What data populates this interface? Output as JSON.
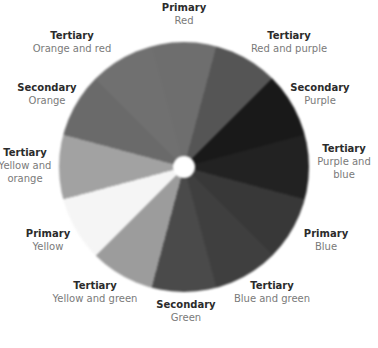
{
  "wheel": {
    "segments": [
      {
        "category": "Primary",
        "name": "Red",
        "shade": "#6e6e6e"
      },
      {
        "category": "Tertiary",
        "name": "Red and purple",
        "shade": "#555555"
      },
      {
        "category": "Secondary",
        "name": "Purple",
        "shade": "#191919"
      },
      {
        "category": "Tertiary",
        "name": "Purple and blue",
        "shade": "#222222"
      },
      {
        "category": "Primary",
        "name": "Blue",
        "shade": "#383838"
      },
      {
        "category": "Tertiary",
        "name": "Blue and green",
        "shade": "#3f3f3f"
      },
      {
        "category": "Secondary",
        "name": "Green",
        "shade": "#4a4a4a"
      },
      {
        "category": "Tertiary",
        "name": "Yellow and green",
        "shade": "#9c9c9c"
      },
      {
        "category": "Primary",
        "name": "Yellow",
        "shade": "#f5f5f5"
      },
      {
        "category": "Tertiary",
        "name": "Yellow and orange",
        "shade": "#a2a2a2"
      },
      {
        "category": "Secondary",
        "name": "Orange",
        "shade": "#6a6a6a"
      },
      {
        "category": "Tertiary",
        "name": "Orange and red",
        "shade": "#707070"
      }
    ]
  },
  "labels": {
    "red": {
      "kind": "Primary",
      "name": "Red"
    },
    "red_purple": {
      "kind": "Tertiary",
      "name": "Red and purple"
    },
    "purple": {
      "kind": "Secondary",
      "name": "Purple"
    },
    "purple_blue": {
      "kind": "Tertiary",
      "name": "Purple and blue"
    },
    "blue": {
      "kind": "Primary",
      "name": "Blue"
    },
    "blue_green": {
      "kind": "Tertiary",
      "name": "Blue and green"
    },
    "green": {
      "kind": "Secondary",
      "name": "Green"
    },
    "yellow_green": {
      "kind": "Tertiary",
      "name": "Yellow and green"
    },
    "yellow": {
      "kind": "Primary",
      "name": "Yellow"
    },
    "yellow_orange": {
      "kind": "Tertiary",
      "name": "Yellow and orange"
    },
    "orange": {
      "kind": "Secondary",
      "name": "Orange"
    },
    "orange_red": {
      "kind": "Tertiary",
      "name": "Orange and red"
    }
  }
}
